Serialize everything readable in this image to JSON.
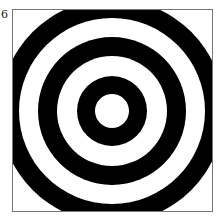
{
  "panel": {
    "label": "6",
    "pattern": "concentric-rings",
    "colors": {
      "ring": "#000000",
      "background": "#ffffff",
      "frame": "#777777"
    },
    "center": [
      99,
      101
    ],
    "ring_radii": [
      {
        "r": 112,
        "fill": "#000000"
      },
      {
        "r": 93,
        "fill": "#ffffff"
      },
      {
        "r": 74,
        "fill": "#000000"
      },
      {
        "r": 55,
        "fill": "#ffffff"
      },
      {
        "r": 35,
        "fill": "#000000"
      },
      {
        "r": 17,
        "fill": "#ffffff"
      }
    ]
  }
}
